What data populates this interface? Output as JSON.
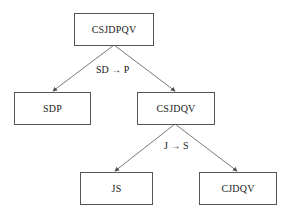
{
  "diagram": {
    "type": "decomposition-tree",
    "nodes": [
      {
        "id": "root",
        "label": "CSJDPQV"
      },
      {
        "id": "sdp",
        "label": "SDP"
      },
      {
        "id": "csjdqv",
        "label": "CSJDQV"
      },
      {
        "id": "js",
        "label": "JS"
      },
      {
        "id": "cjdqv",
        "label": "CJDQV"
      }
    ],
    "edges": [
      {
        "from": "root",
        "to": "sdp"
      },
      {
        "from": "root",
        "to": "csjdqv"
      },
      {
        "from": "csjdqv",
        "to": "js"
      },
      {
        "from": "csjdqv",
        "to": "cjdqv"
      }
    ],
    "edge_labels": [
      {
        "text": "SD → P"
      },
      {
        "text": "J → S"
      }
    ]
  },
  "colors": {
    "line": "#555555",
    "border": "#555555",
    "background": "#ffffff"
  }
}
